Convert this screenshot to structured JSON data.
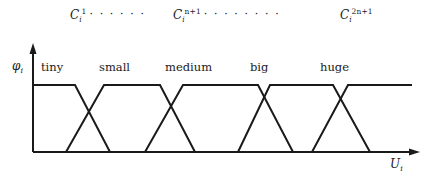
{
  "figure": {
    "width": 436,
    "height": 187,
    "background": "#ffffff",
    "line_color": "#1a1a1a"
  },
  "axes": {
    "y_label": "φ",
    "y_label_sub": "i",
    "x_label": "U",
    "x_label_sub": "i",
    "origin_x": 33,
    "baseline_y": 152,
    "plateau_y": 85,
    "y_axis_top": 45,
    "x_axis_right": 420
  },
  "top_annotations": [
    {
      "name": "cluster-first",
      "base": "C",
      "sub": "i",
      "sup": "1",
      "ellipsis": "· · · · · ·",
      "x": 70,
      "y": 8
    },
    {
      "name": "cluster-middle",
      "base": "C",
      "sub": "i",
      "sup": "n+1",
      "ellipsis": "· · · · · · · ·",
      "x": 173,
      "y": 8
    },
    {
      "name": "cluster-last",
      "base": "C",
      "sub": "i",
      "sup": "2n+1",
      "ellipsis": "",
      "x": 340,
      "y": 8
    }
  ],
  "chart_data": {
    "type": "line",
    "title": "",
    "xlabel": "U_i",
    "ylabel": "φ_i",
    "grid": false,
    "legend": "none",
    "xlim": [
      33,
      420
    ],
    "ylim": [
      0,
      1
    ],
    "categories": [
      "tiny",
      "small",
      "medium",
      "big",
      "huge"
    ],
    "category_label_positions": [
      {
        "label": "tiny",
        "x": 41,
        "y": 66
      },
      {
        "label": "small",
        "x": 99,
        "y": 66
      },
      {
        "label": "medium",
        "x": 165,
        "y": 66
      },
      {
        "label": "big",
        "x": 250,
        "y": 66
      },
      {
        "label": "huge",
        "x": 320,
        "y": 66
      }
    ],
    "series": [
      {
        "name": "tiny",
        "shape": "trapezoid",
        "points": [
          [
            33,
            1
          ],
          [
            33,
            1
          ],
          [
            75,
            1
          ],
          [
            110,
            0
          ]
        ],
        "px_points": "33,85 75,85 110,152"
      },
      {
        "name": "small",
        "shape": "trapezoid",
        "points": [
          [
            66,
            0
          ],
          [
            104,
            1
          ],
          [
            160,
            1
          ],
          [
            195,
            0
          ]
        ],
        "px_points": "66,152 104,85 160,85 195,152"
      },
      {
        "name": "medium",
        "shape": "trapezoid",
        "points": [
          [
            145,
            0
          ],
          [
            183,
            1
          ],
          [
            258,
            1
          ],
          [
            293,
            0
          ]
        ],
        "px_points": "145,152 183,85 258,85 293,152"
      },
      {
        "name": "big",
        "shape": "trapezoid",
        "points": [
          [
            238,
            0
          ],
          [
            270,
            1
          ],
          [
            333,
            1
          ],
          [
            370,
            0
          ]
        ],
        "px_points": "238,152 270,85 333,85 370,152"
      },
      {
        "name": "huge",
        "shape": "trapezoid",
        "points": [
          [
            312,
            0
          ],
          [
            348,
            1
          ],
          [
            412,
            1
          ],
          [
            412,
            1
          ]
        ],
        "px_points": "312,152 348,85 412,85"
      }
    ]
  }
}
